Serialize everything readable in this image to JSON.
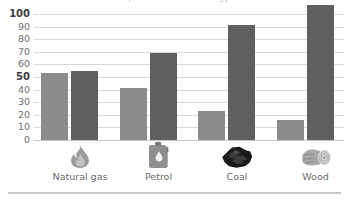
{
  "chart_data": {
    "type": "bar",
    "title": "Comparison of fuels: energy and emissions",
    "xlabel": "",
    "ylabel": "",
    "ylim": [
      0,
      100
    ],
    "yticks": [
      0,
      10,
      20,
      30,
      40,
      50,
      60,
      70,
      80,
      90,
      100
    ],
    "ytick_labels": [
      "0",
      "10",
      "20",
      "30",
      "40",
      "50",
      "60",
      "70",
      "80",
      "90",
      "100"
    ],
    "emphasised_yticks": [
      "50",
      "100"
    ],
    "grid": "horizontal",
    "legend": "none",
    "categories": [
      "Natural gas",
      "Petrol",
      "Coal",
      "Wood"
    ],
    "series": [
      {
        "name": "Series 1",
        "color": "#8b8b8d",
        "values": [
          53,
          41,
          23,
          16
        ]
      },
      {
        "name": "Series 2",
        "color": "#5f5f61",
        "values": [
          55,
          69,
          91,
          107
        ]
      }
    ]
  },
  "axis": {
    "ticks": [
      {
        "value": 100,
        "label": "100",
        "bold": true
      },
      {
        "value": 90,
        "label": "90",
        "bold": false
      },
      {
        "value": 80,
        "label": "80",
        "bold": false
      },
      {
        "value": 70,
        "label": "70",
        "bold": false
      },
      {
        "value": 60,
        "label": "60",
        "bold": false
      },
      {
        "value": 50,
        "label": "50",
        "bold": true
      },
      {
        "value": 40,
        "label": "40",
        "bold": false
      },
      {
        "value": 30,
        "label": "30",
        "bold": false
      },
      {
        "value": 20,
        "label": "20",
        "bold": false
      },
      {
        "value": 10,
        "label": "10",
        "bold": false
      },
      {
        "value": 0,
        "label": "0",
        "bold": false
      }
    ]
  },
  "categories": [
    {
      "label": "Natural gas",
      "icon": "flame-icon",
      "light": 53,
      "dark": 55
    },
    {
      "label": "Petrol",
      "icon": "jerrycan-icon",
      "light": 41,
      "dark": 69
    },
    {
      "label": "Coal",
      "icon": "coal-lump-icon",
      "light": 23,
      "dark": 91
    },
    {
      "label": "Wood",
      "icon": "wood-log-icon",
      "light": 16,
      "dark": 107
    }
  ],
  "colors": {
    "series_light": "#8b8b8d",
    "series_dark": "#5f5f61",
    "gridline": "#d8d8da",
    "text": "#6a6a6d"
  }
}
